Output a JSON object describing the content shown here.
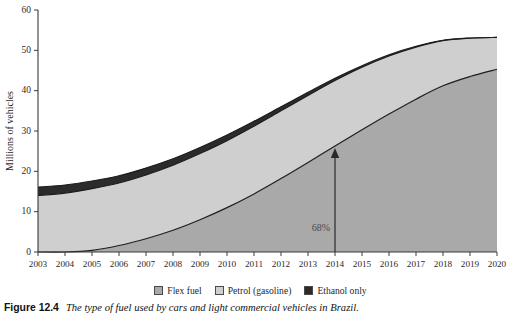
{
  "figure": {
    "caption_number": "Figure 12.4",
    "caption_text": "The type of fuel used by cars and light commercial vehicles in Brazil."
  },
  "legend": {
    "position": "bottom-center",
    "items": [
      {
        "label": "Flex fuel",
        "color": "#a9a9a9"
      },
      {
        "label": "Petrol (gasoline)",
        "color": "#cfcfcf"
      },
      {
        "label": "Ethanol only",
        "color": "#2b2b2b"
      }
    ]
  },
  "annotations": [
    {
      "name": "percent-callout",
      "text": "68%",
      "at_year": "2014"
    }
  ],
  "axes": {
    "y_title": "Millions of vehicles",
    "y_ticks": [
      "0",
      "10",
      "20",
      "30",
      "40",
      "50",
      "60"
    ],
    "x_ticks": [
      "2003",
      "2004",
      "2005",
      "2006",
      "2007",
      "2008",
      "2009",
      "2010",
      "2011",
      "2012",
      "2013",
      "2014",
      "2015",
      "2016",
      "2017",
      "2018",
      "2019",
      "2020"
    ]
  },
  "chart_data": {
    "type": "area",
    "title": "",
    "subtitle": "",
    "xlabel": "",
    "ylabel": "Millions of vehicles",
    "xlim": [
      2003,
      2020
    ],
    "ylim": [
      0,
      60
    ],
    "grid": false,
    "legend_position": "bottom-center",
    "stacked": true,
    "x": [
      2003,
      2004,
      2005,
      2006,
      2007,
      2008,
      2009,
      2010,
      2011,
      2012,
      2013,
      2014,
      2015,
      2016,
      2017,
      2018,
      2019,
      2020
    ],
    "series": [
      {
        "name": "Flex fuel",
        "color": "#a9a9a9",
        "values": [
          0,
          0,
          0.4,
          1.6,
          3.3,
          5.4,
          8.0,
          11.0,
          14.4,
          18.2,
          22.2,
          26.3,
          30.3,
          34.2,
          37.9,
          41.2,
          43.5,
          45.3
        ]
      },
      {
        "name": "Petrol (gasoline)",
        "color": "#cfcfcf",
        "values": [
          14.0,
          14.6,
          15.3,
          15.5,
          15.8,
          16.1,
          16.4,
          16.6,
          16.8,
          16.8,
          16.6,
          16.2,
          15.5,
          14.4,
          12.9,
          11.2,
          9.5,
          7.9
        ]
      },
      {
        "name": "Ethanol only",
        "color": "#2b2b2b",
        "values": [
          2.1,
          2.0,
          1.9,
          1.8,
          1.7,
          1.6,
          1.5,
          1.4,
          1.2,
          1.0,
          0.8,
          0.6,
          0.4,
          0.3,
          0.2,
          0.1,
          0.05,
          0.0
        ]
      }
    ],
    "totals": [
      16.1,
      16.6,
      17.6,
      18.9,
      20.8,
      23.1,
      25.9,
      29.0,
      32.4,
      36.0,
      39.6,
      43.1,
      46.2,
      48.9,
      51.0,
      52.5,
      53.05,
      53.2
    ],
    "annotation": {
      "label": "68%",
      "x": 2014
    }
  }
}
